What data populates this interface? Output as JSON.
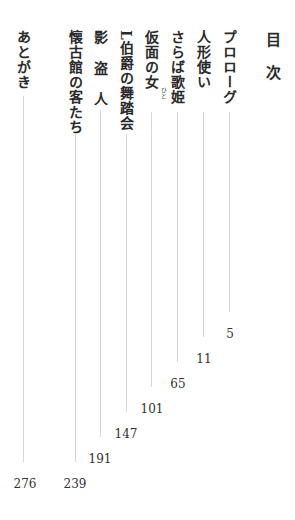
{
  "heading": "目次",
  "entries": [
    {
      "title": "プロローグ",
      "page": "5"
    },
    {
      "title": "人形使い",
      "page": "11"
    },
    {
      "title": "さらば歌姫",
      "page": "65"
    },
    {
      "title": "仮面の女",
      "ruby": "ひと",
      "page": "101"
    },
    {
      "title": "L伯爵の舞踏会",
      "page": "147"
    },
    {
      "title": "影 盗 人",
      "page": "191"
    },
    {
      "title": "懐古館の客たち",
      "page": "239"
    },
    {
      "title": "あとがき",
      "page": "276"
    }
  ]
}
